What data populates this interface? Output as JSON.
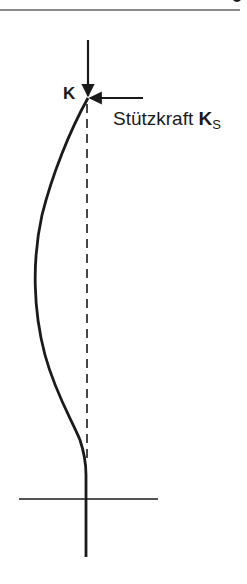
{
  "diagram": {
    "labels": {
      "load_force": "K",
      "support_force_text": "Stützkraft",
      "support_force_symbol": "K",
      "support_force_subscript": "S"
    },
    "colors": {
      "stroke": "#1a1a1a",
      "rule": "#8a8a8a",
      "background": "#ffffff"
    },
    "elements": [
      "top-rule",
      "load-arrow-K",
      "support-arrow-KS",
      "buckled-column-curve",
      "dashed-centerline",
      "ground-line"
    ]
  }
}
